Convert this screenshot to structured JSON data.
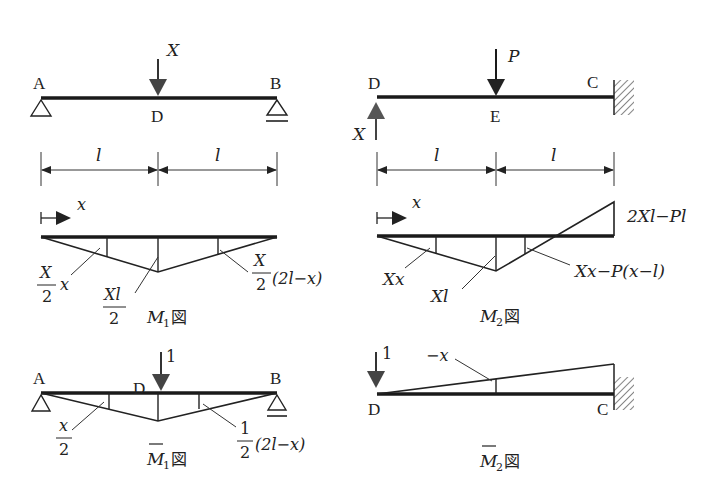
{
  "figure": {
    "top_left": {
      "points": {
        "left": "A",
        "mid": "D",
        "right": "B"
      },
      "load_label": "X",
      "spans": [
        "l",
        "l"
      ]
    },
    "top_right": {
      "points": {
        "left": "D",
        "mid": "E",
        "right": "C"
      },
      "load_label": "P",
      "reaction_label": "X",
      "spans": [
        "l",
        "l"
      ]
    },
    "m1": {
      "coord_label": "x",
      "labels": {
        "left_num": "X",
        "left_den": "2",
        "left_var": "x",
        "mid_num": "Xl",
        "mid_den": "2",
        "right_num": "X",
        "right_den": "2",
        "right_expr": "(2l−x)"
      },
      "caption_var": "M",
      "caption_sub": "1",
      "caption_suffix": "図"
    },
    "m2": {
      "coord_label": "x",
      "labels": {
        "left": "Xx",
        "mid": "Xl",
        "right": "Xx−P(x−l)",
        "end": "2Xl−Pl"
      },
      "caption_var": "M",
      "caption_sub": "2",
      "caption_suffix": "図"
    },
    "m1_bar": {
      "points": {
        "left": "A",
        "mid": "D",
        "right": "B"
      },
      "load_label": "1",
      "labels": {
        "left_num": "x",
        "left_den": "2",
        "right_num": "1",
        "right_den": "2",
        "right_expr": "(2l−x)"
      },
      "caption_var": "M",
      "caption_sub": "1",
      "caption_suffix": "図"
    },
    "m2_bar": {
      "points": {
        "left": "D",
        "right": "C"
      },
      "load_label": "1",
      "labels": {
        "mid": "−x"
      },
      "caption_var": "M",
      "caption_sub": "2",
      "caption_suffix": "図"
    }
  }
}
